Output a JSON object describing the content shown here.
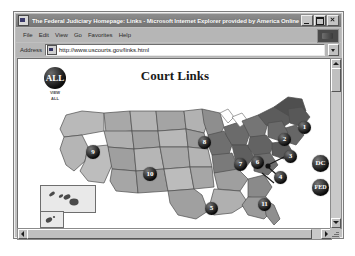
{
  "window": {
    "title": "The Federal Judiciary Homepage: Links - Microsoft Internet Explorer provided by America Online",
    "app_icon": "ie-icon",
    "controls": [
      {
        "name": "minimize",
        "glyph": "_"
      },
      {
        "name": "maximize",
        "glyph": "□"
      },
      {
        "name": "close",
        "glyph": "×"
      }
    ]
  },
  "menu": {
    "items": [
      {
        "label": "File"
      },
      {
        "label": "Edit"
      },
      {
        "label": "View"
      },
      {
        "label": "Go"
      },
      {
        "label": "Favorites"
      },
      {
        "label": "Help"
      }
    ],
    "brand_button": "ie-logo-button"
  },
  "address": {
    "label": "Address",
    "url": "http://www.uscourts.gov/links.html",
    "placeholder": "http://",
    "doc_icon": "document-icon",
    "dropdown_icon": "chevron-down-icon"
  },
  "page": {
    "title": "Court Links",
    "view_all": {
      "badge": "ALL",
      "caption_line1": "VIEW",
      "caption_line2": "ALL"
    },
    "badges": [
      {
        "label": "1",
        "name": "circuit-1",
        "x": 246,
        "y": 34,
        "size": 13
      },
      {
        "label": "2",
        "name": "circuit-2",
        "x": 226,
        "y": 46,
        "size": 13
      },
      {
        "label": "3",
        "name": "circuit-3",
        "x": 232,
        "y": 63,
        "size": 13
      },
      {
        "label": "4",
        "name": "circuit-4",
        "x": 222,
        "y": 84,
        "size": 13
      },
      {
        "label": "5",
        "name": "circuit-5",
        "x": 153,
        "y": 115,
        "size": 13
      },
      {
        "label": "6",
        "name": "circuit-6",
        "x": 199,
        "y": 69,
        "size": 13
      },
      {
        "label": "7",
        "name": "circuit-7",
        "x": 182,
        "y": 71,
        "size": 13
      },
      {
        "label": "8",
        "name": "circuit-8",
        "x": 146,
        "y": 49,
        "size": 13
      },
      {
        "label": "9",
        "name": "circuit-9",
        "x": 34,
        "y": 58,
        "size": 14
      },
      {
        "label": "10",
        "name": "circuit-10",
        "x": 91,
        "y": 80,
        "size": 14
      },
      {
        "label": "11",
        "name": "circuit-11",
        "x": 206,
        "y": 111,
        "size": 13
      },
      {
        "label": "DC",
        "name": "circuit-dc",
        "x": 262,
        "y": 68,
        "size": 16
      },
      {
        "label": "FED",
        "name": "circuit-fed",
        "x": 262,
        "y": 92,
        "size": 16
      }
    ],
    "insets": [
      {
        "name": "hawaii-inset"
      },
      {
        "name": "alaska-inset"
      }
    ]
  },
  "scrollbars": {
    "vertical": {
      "up": "scroll-up-arrow",
      "down": "scroll-down-arrow",
      "thumb": "vertical-thumb"
    },
    "horizontal": {
      "left": "scroll-left-arrow",
      "right": "scroll-right-arrow",
      "thumb": "horizontal-thumb"
    }
  },
  "colors": {
    "window_face": "#c0c0c0",
    "titlebar": "#7d7d7d",
    "page_bg": "#ffffff",
    "badge": "#0c0c0c",
    "map_light": "#b9b9b9",
    "map_mid": "#9a9a9a",
    "map_dark": "#6f6f6f"
  }
}
